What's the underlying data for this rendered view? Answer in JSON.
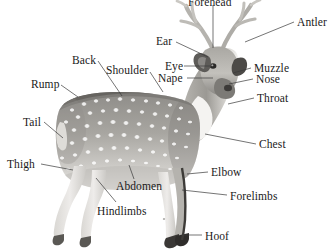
{
  "figure": {
    "background_color": "#ffffff",
    "text_color": "#1a1a1a",
    "leader_line_color": "#3a3a3a"
  },
  "labels": [
    {
      "id": "forehead",
      "text": "Forehead",
      "x": 188,
      "y": -4,
      "anchor": "start",
      "leader": {
        "x1": 213,
        "y1": 5,
        "x2": 213,
        "y2": 48
      },
      "clipped_top": true
    },
    {
      "id": "antler",
      "text": "Antler",
      "x": 297,
      "y": 16,
      "anchor": "start",
      "leader": {
        "x1": 294,
        "y1": 22,
        "x2": 245,
        "y2": 42
      }
    },
    {
      "id": "ear",
      "text": "Ear",
      "x": 156,
      "y": 35,
      "anchor": "start",
      "leader": {
        "x1": 176,
        "y1": 42,
        "x2": 208,
        "y2": 57
      }
    },
    {
      "id": "back",
      "text": "Back",
      "x": 72,
      "y": 54,
      "anchor": "start",
      "leader": {
        "x1": 98,
        "y1": 61,
        "x2": 122,
        "y2": 96
      }
    },
    {
      "id": "shoulder",
      "text": "Shoulder",
      "x": 106,
      "y": 64,
      "anchor": "start",
      "leader": {
        "x1": 150,
        "y1": 72,
        "x2": 163,
        "y2": 92
      }
    },
    {
      "id": "eye",
      "text": "Eye",
      "x": 165,
      "y": 60,
      "anchor": "start",
      "leader": {
        "x1": 184,
        "y1": 66,
        "x2": 213,
        "y2": 66
      }
    },
    {
      "id": "muzzle",
      "text": "Muzzle",
      "x": 254,
      "y": 62,
      "anchor": "start",
      "leader": {
        "x1": 251,
        "y1": 68,
        "x2": 233,
        "y2": 73
      }
    },
    {
      "id": "nape",
      "text": "Nape",
      "x": 158,
      "y": 72,
      "anchor": "start",
      "leader": {
        "x1": 187,
        "y1": 78,
        "x2": 213,
        "y2": 78
      }
    },
    {
      "id": "nose",
      "text": "Nose",
      "x": 256,
      "y": 73,
      "anchor": "start",
      "leader": {
        "x1": 253,
        "y1": 79,
        "x2": 229,
        "y2": 84
      }
    },
    {
      "id": "rump",
      "text": "Rump",
      "x": 31,
      "y": 78,
      "anchor": "start",
      "leader": {
        "x1": 61,
        "y1": 85,
        "x2": 78,
        "y2": 97
      }
    },
    {
      "id": "throat",
      "text": "Throat",
      "x": 257,
      "y": 92,
      "anchor": "start",
      "leader": {
        "x1": 254,
        "y1": 98,
        "x2": 228,
        "y2": 104
      }
    },
    {
      "id": "tail",
      "text": "Tail",
      "x": 23,
      "y": 116,
      "anchor": "start",
      "leader": {
        "x1": 44,
        "y1": 122,
        "x2": 63,
        "y2": 138
      }
    },
    {
      "id": "chest",
      "text": "Chest",
      "x": 259,
      "y": 138,
      "anchor": "start",
      "leader": {
        "x1": 256,
        "y1": 144,
        "x2": 205,
        "y2": 134
      }
    },
    {
      "id": "thigh",
      "text": "Thigh",
      "x": 7,
      "y": 158,
      "anchor": "start",
      "leader": {
        "x1": 41,
        "y1": 164,
        "x2": 73,
        "y2": 170
      }
    },
    {
      "id": "elbow",
      "text": "Elbow",
      "x": 211,
      "y": 166,
      "anchor": "start",
      "leader": {
        "x1": 208,
        "y1": 172,
        "x2": 187,
        "y2": 174
      }
    },
    {
      "id": "abdomen",
      "text": "Abdomen",
      "x": 116,
      "y": 180,
      "anchor": "start",
      "leader": {
        "x1": 134,
        "y1": 179,
        "x2": 129,
        "y2": 165
      }
    },
    {
      "id": "forelimbs",
      "text": "Forelimbs",
      "x": 230,
      "y": 190,
      "anchor": "start",
      "leader": {
        "x1": 227,
        "y1": 195,
        "x2": 182,
        "y2": 190
      }
    },
    {
      "id": "hindlimbs",
      "text": "Hindlimbs",
      "x": 97,
      "y": 205,
      "anchor": "start",
      "leader": {
        "x1": 116,
        "y1": 202,
        "x2": 96,
        "y2": 178
      }
    },
    {
      "id": "hoof",
      "text": "Hoof",
      "x": 205,
      "y": 230,
      "anchor": "start",
      "leader": {
        "x1": 202,
        "y1": 235,
        "x2": 183,
        "y2": 235
      }
    }
  ]
}
